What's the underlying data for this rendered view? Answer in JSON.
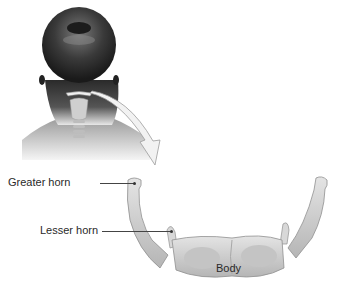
{
  "diagram": {
    "labels": {
      "greater_horn": "Greater horn",
      "lesser_horn": "Lesser horn",
      "body": "Body"
    },
    "colors": {
      "bone": "#d6d6d6",
      "bone_shadow": "#9a9a9a",
      "skin_dark": "#2b2b2b",
      "skin_mid": "#6b6b6b",
      "arrow_fill": "#f2f2f2",
      "arrow_stroke": "#9c9c9c",
      "text": "#2a2a2a"
    }
  }
}
